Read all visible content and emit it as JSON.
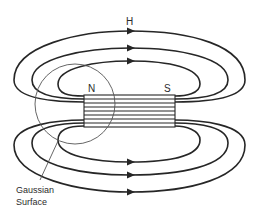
{
  "diagram": {
    "labels": {
      "field": "H",
      "north_pole": "N",
      "south_pole": "S",
      "gaussian_line1": "Gaussian",
      "gaussian_line2": "Surface"
    },
    "colors": {
      "line": "#262626",
      "background": "#ffffff"
    },
    "elements": {
      "field_loops_top": 3,
      "field_loops_bottom": 3,
      "arrow_direction": "left-to-right (outside magnet, from N side over to S side along top and bottom)",
      "magnet": "horizontal bar with internal parallel field lines",
      "gaussian_surface": "circle enclosing the N pole"
    }
  }
}
